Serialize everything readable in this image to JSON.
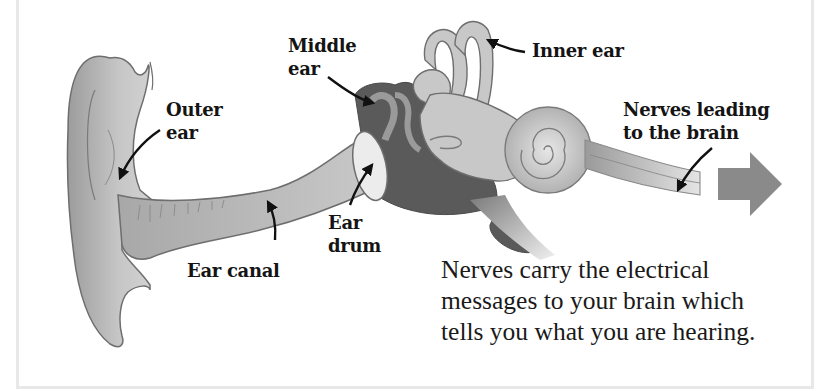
{
  "diagram": {
    "labels": {
      "outer_ear": "Outer\near",
      "middle_ear": "Middle\near",
      "inner_ear": "Inner ear",
      "nerves": "Nerves leading\nto the brain",
      "ear_canal": "Ear canal",
      "ear_drum": "Ear\ndrum"
    },
    "caption": "Nerves carry the electrical\nmessages to your brain which\ntells you what you are hearing.",
    "colors": {
      "ear_fill": "#b4b4b4",
      "ear_outline": "#6e6e6e",
      "middle_ear_dark": "#5a5a5a",
      "arrow": "#8a8a8a",
      "text": "#141414",
      "frame_border": "#e8e8e8"
    }
  }
}
